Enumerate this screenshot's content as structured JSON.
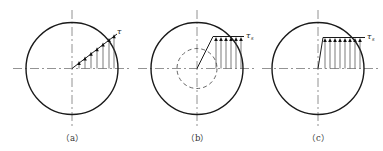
{
  "figure": {
    "panels": [
      {
        "id": "a",
        "caption": "（a）",
        "label_symbol": "τ",
        "label_subscript": "",
        "description": "Linear shear stress distribution, zero at center increasing to maximum at outer radius (elastic)"
      },
      {
        "id": "b",
        "caption": "（b）",
        "label_symbol": "τ",
        "label_subscript": "s",
        "description": "Elastic-plastic shear stress distribution: linear inside dashed elastic core, constant yield stress τs in plastic zone"
      },
      {
        "id": "c",
        "caption": "（c）",
        "label_symbol": "τ",
        "label_subscript": "s",
        "description": "Fully plastic shear stress distribution: nearly uniform yield stress τs across the radius"
      }
    ],
    "colors": {
      "line": "#1a1a1a",
      "centerline": "#777777",
      "background": "#ffffff"
    }
  }
}
